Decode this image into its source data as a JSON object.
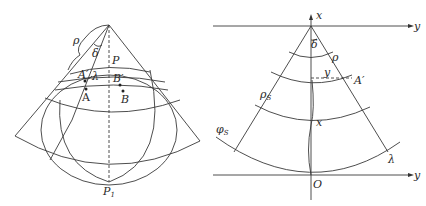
{
  "figure": {
    "left_panel": {
      "description": "Conic projection cone over sphere",
      "labels": {
        "rho": "ρ",
        "delta": "δ",
        "P": "P",
        "A_prime": "A′",
        "lambda": "λ",
        "B_prime": "B′",
        "A": "A",
        "B": "B",
        "P1": "P",
        "P1_sub": "1"
      }
    },
    "right_panel": {
      "description": "Developed cone with plane coordinates",
      "labels": {
        "x_top": "x",
        "y_top": "y",
        "delta": "δ",
        "rho": "ρ",
        "y_mid": "y",
        "A_prime": "A′",
        "rho_s": "ρ",
        "rho_s_sub": "S",
        "x_mid": "x",
        "phi_s": "φ",
        "phi_s_sub": "S",
        "lambda": "λ",
        "y_bottom": "y",
        "origin": "O"
      }
    }
  }
}
